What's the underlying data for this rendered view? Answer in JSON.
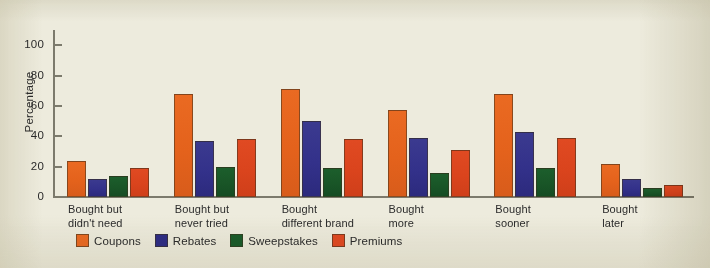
{
  "chart_data": {
    "type": "bar",
    "title": "",
    "xlabel": "",
    "ylabel": "Percentage",
    "ylim": [
      0,
      110
    ],
    "yticks": [
      0,
      20,
      40,
      60,
      80,
      100
    ],
    "grid": false,
    "legend_position": "bottom-left",
    "categories": [
      "Bought but\ndidn't need",
      "Bought but\nnever tried",
      "Bought\ndifferent brand",
      "Bought\nmore",
      "Bought\nsooner",
      "Bought\nlater"
    ],
    "series": [
      {
        "name": "Coupons",
        "color": "#ea6a22",
        "values": [
          24,
          68,
          71,
          57,
          68,
          22
        ]
      },
      {
        "name": "Rebates",
        "color": "#2f2d86",
        "values": [
          12,
          37,
          50,
          39,
          43,
          12
        ]
      },
      {
        "name": "Sweepstakes",
        "color": "#1b5c2b",
        "values": [
          14,
          20,
          19,
          16,
          19,
          6
        ]
      },
      {
        "name": "Premiums",
        "color": "#e04a22",
        "values": [
          19,
          38,
          38,
          31,
          39,
          8
        ]
      }
    ]
  },
  "axis": {
    "y_label": "Percentage",
    "y_ticks": [
      "0",
      "20",
      "40",
      "60",
      "80",
      "100"
    ]
  },
  "legend": {
    "items": [
      {
        "label": "Coupons"
      },
      {
        "label": "Rebates"
      },
      {
        "label": "Sweepstakes"
      },
      {
        "label": "Premiums"
      }
    ]
  }
}
